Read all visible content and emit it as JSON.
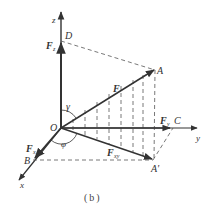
{
  "figure": {
    "caption": "(b)",
    "colors": {
      "line": "#333333",
      "dash": "#555555",
      "background": "#ffffff"
    },
    "axes": {
      "z": "z",
      "y": "y",
      "x": "x"
    },
    "points": {
      "origin": "O",
      "D": "D",
      "A": "A",
      "A_prime": "A'",
      "B": "B",
      "C": "C"
    },
    "vectors": {
      "F": "F",
      "Fz": "F",
      "Fz_sub": "z",
      "Fy": "F",
      "Fy_sub": "y",
      "Fx": "F",
      "Fx_sub": "x",
      "Fxy": "F",
      "Fxy_sub": "xy"
    },
    "angles": {
      "gamma": "γ",
      "phi": "φ"
    }
  }
}
